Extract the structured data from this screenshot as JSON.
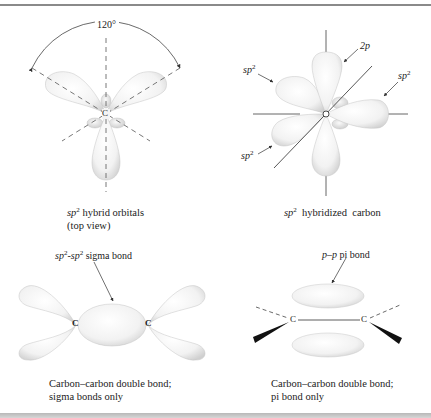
{
  "figure": {
    "panels": [
      {
        "id": "sp2-top-view",
        "angle_label": "120°",
        "atom_label": "C",
        "caption_line1_prefix": "sp",
        "caption_line1_sup": "2",
        "caption_line1_rest": " hybrid orbitals",
        "caption_line2": "(top view)"
      },
      {
        "id": "sp2-hybridized-carbon",
        "atom_label": "C",
        "labels": [
          {
            "text": "sp",
            "sup": "2",
            "position": "upper-left"
          },
          {
            "text": "2p",
            "sup": "",
            "position": "top"
          },
          {
            "text": "sp",
            "sup": "2",
            "position": "right"
          },
          {
            "text": "sp",
            "sup": "2",
            "position": "lower-left"
          }
        ],
        "caption_prefix": "sp",
        "caption_sup": "2",
        "caption_rest": "  hybridized  carbon"
      },
      {
        "id": "sigma-bond",
        "bond_label_a": "sp",
        "bond_label_a_sup": "2",
        "bond_label_sep": "-",
        "bond_label_b": "sp",
        "bond_label_b_sup": "2",
        "bond_label_rest": " sigma bond",
        "atom_left": "C",
        "atom_right": "C",
        "caption_line1": "Carbon–carbon double bond;",
        "caption_line2": "sigma bonds only"
      },
      {
        "id": "pi-bond",
        "bond_label_italic": "p–p",
        "bond_label_rest": " pi bond",
        "atom_left": "C",
        "atom_right": "C",
        "caption_line1": "Carbon–carbon double bond;",
        "caption_line2": "pi bond only"
      }
    ]
  }
}
